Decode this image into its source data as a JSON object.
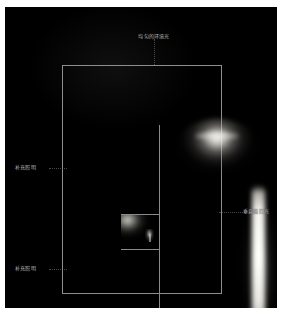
{
  "diagram": {
    "title_top": "均匀的环境光",
    "labels": {
      "ambient_ceiling": "均匀的环境光",
      "accent_upper": "补充照明",
      "accent_lower": "补充照明",
      "vertical_wall": "垂直面灯光"
    },
    "colors": {
      "background": "#000000",
      "page": "#ffffff",
      "wall_line": "#8e8e8e",
      "label_text": "#bdbdbd",
      "light_warm_white": "#fffdf5",
      "light_core": "#fffffc"
    },
    "light_sources": [
      {
        "name": "ceiling-ambient-dome",
        "label": "均匀的环境光",
        "type": "diffuse-dome",
        "position": "ceiling-center",
        "intensity": "high"
      },
      {
        "name": "vertical-wall-strip",
        "label": "垂直面灯光",
        "type": "linear-strip",
        "position": "right-wall",
        "intensity": "high"
      },
      {
        "name": "accent-alcove-upper",
        "label": "补充照明",
        "type": "accent-wash",
        "position": "left-alcove-upper",
        "intensity": "medium"
      },
      {
        "name": "accent-alcove-lower",
        "label": "补充照明",
        "type": "accent-wash",
        "position": "left-alcove-lower",
        "intensity": "medium"
      }
    ]
  }
}
